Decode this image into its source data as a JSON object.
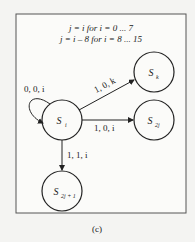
{
  "header": {
    "line1": "j = i for i = 0 ... 7",
    "line2": "j = i – 8 for i = 8 ... 15"
  },
  "nodes": {
    "si": {
      "label": "S",
      "sub": "i"
    },
    "sk": {
      "label": "S",
      "sub": "k"
    },
    "s2j": {
      "label": "S",
      "sub": "2j"
    },
    "s2j1": {
      "label": "S",
      "sub": "2j + 1"
    }
  },
  "edges": {
    "self": "0, 0, i",
    "to_sk": "1, 0, k",
    "to_s2j": "1, 0, i",
    "to_s2j1": "1, 1, i"
  },
  "caption": "(c)",
  "colors": {
    "background": "#f4f4f2",
    "stroke": "#222222",
    "frame": "#555555"
  }
}
